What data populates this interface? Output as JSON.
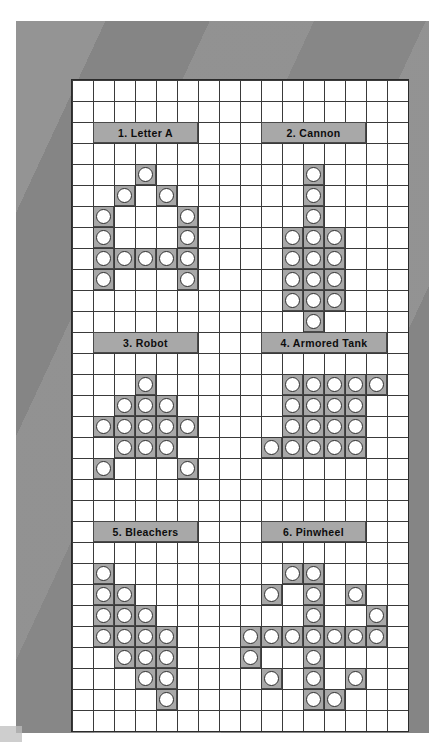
{
  "page": {
    "background_color": "#ffffff",
    "frame_color": "#8c8c8c",
    "board_color": "#ffffff",
    "gridline_color": "#3a3a3a",
    "filled_cell_color": "#a8a8a8",
    "disc_color": "#ffffff",
    "disc_outline_color": "#2e2e2e",
    "label_bar_color": "#a8a8a8",
    "label_text_color": "#0d0d0d"
  },
  "grid": {
    "columns": 16,
    "rows": 31,
    "cell_size_px": 21
  },
  "puzzles": [
    {
      "number": "1",
      "name": "Letter A",
      "label": "1. Letter A",
      "label_col": 1,
      "label_row": 2,
      "label_span": 5,
      "cells": [
        [
          3,
          4
        ],
        [
          2,
          5
        ],
        [
          4,
          5
        ],
        [
          1,
          6
        ],
        [
          5,
          6
        ],
        [
          1,
          7
        ],
        [
          5,
          7
        ],
        [
          1,
          8
        ],
        [
          2,
          8
        ],
        [
          3,
          8
        ],
        [
          4,
          8
        ],
        [
          5,
          8
        ],
        [
          1,
          9
        ],
        [
          5,
          9
        ]
      ]
    },
    {
      "number": "2",
      "name": "Cannon",
      "label": "2. Cannon",
      "label_col": 9,
      "label_row": 2,
      "label_span": 5,
      "cells": [
        [
          11,
          4
        ],
        [
          11,
          5
        ],
        [
          11,
          6
        ],
        [
          10,
          7
        ],
        [
          11,
          7
        ],
        [
          12,
          7
        ],
        [
          10,
          8
        ],
        [
          11,
          8
        ],
        [
          12,
          8
        ],
        [
          10,
          9
        ],
        [
          11,
          9
        ],
        [
          12,
          9
        ],
        [
          10,
          10
        ],
        [
          11,
          10
        ],
        [
          12,
          10
        ],
        [
          11,
          11
        ]
      ]
    },
    {
      "number": "3",
      "name": "Robot",
      "label": "3. Robot",
      "label_col": 1,
      "label_row": 12,
      "label_span": 5,
      "cells": [
        [
          3,
          14
        ],
        [
          2,
          15
        ],
        [
          3,
          15
        ],
        [
          4,
          15
        ],
        [
          1,
          16
        ],
        [
          2,
          16
        ],
        [
          3,
          16
        ],
        [
          4,
          16
        ],
        [
          5,
          16
        ],
        [
          2,
          17
        ],
        [
          3,
          17
        ],
        [
          4,
          17
        ],
        [
          1,
          18
        ],
        [
          5,
          18
        ]
      ]
    },
    {
      "number": "4",
      "name": "Armored Tank",
      "label": "4. Armored Tank",
      "label_col": 9,
      "label_row": 12,
      "label_span": 6,
      "cells": [
        [
          10,
          14
        ],
        [
          11,
          14
        ],
        [
          12,
          14
        ],
        [
          13,
          14
        ],
        [
          14,
          14
        ],
        [
          10,
          15
        ],
        [
          11,
          15
        ],
        [
          12,
          15
        ],
        [
          13,
          15
        ],
        [
          10,
          16
        ],
        [
          11,
          16
        ],
        [
          12,
          16
        ],
        [
          13,
          16
        ],
        [
          9,
          17
        ],
        [
          10,
          17
        ],
        [
          11,
          17
        ],
        [
          12,
          17
        ],
        [
          13,
          17
        ]
      ]
    },
    {
      "number": "5",
      "name": "Bleachers",
      "label": "5. Bleachers",
      "label_col": 1,
      "label_row": 21,
      "label_span": 5,
      "cells": [
        [
          1,
          23
        ],
        [
          1,
          24
        ],
        [
          2,
          24
        ],
        [
          1,
          25
        ],
        [
          2,
          25
        ],
        [
          3,
          25
        ],
        [
          1,
          26
        ],
        [
          2,
          26
        ],
        [
          3,
          26
        ],
        [
          4,
          26
        ],
        [
          2,
          27
        ],
        [
          3,
          27
        ],
        [
          4,
          27
        ],
        [
          3,
          28
        ],
        [
          4,
          28
        ],
        [
          4,
          29
        ]
      ]
    },
    {
      "number": "6",
      "name": "Pinwheel",
      "label": "6. Pinwheel",
      "label_col": 9,
      "label_row": 21,
      "label_span": 5,
      "cells": [
        [
          10,
          23
        ],
        [
          11,
          23
        ],
        [
          9,
          24
        ],
        [
          11,
          24
        ],
        [
          13,
          24
        ],
        [
          11,
          25
        ],
        [
          14,
          25
        ],
        [
          8,
          26
        ],
        [
          9,
          26
        ],
        [
          10,
          26
        ],
        [
          11,
          26
        ],
        [
          12,
          26
        ],
        [
          13,
          26
        ],
        [
          14,
          26
        ],
        [
          8,
          27
        ],
        [
          11,
          27
        ],
        [
          9,
          28
        ],
        [
          11,
          28
        ],
        [
          13,
          28
        ],
        [
          11,
          29
        ],
        [
          12,
          29
        ]
      ]
    }
  ]
}
